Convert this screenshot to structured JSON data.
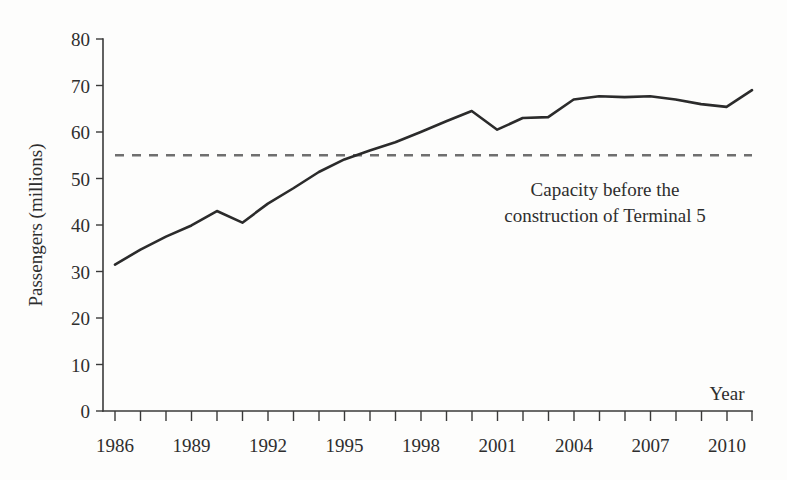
{
  "chart_data": {
    "type": "line",
    "title": "",
    "xlabel": "Year",
    "ylabel": "Passengers (millions)",
    "xlim": [
      1986,
      2011
    ],
    "ylim": [
      0,
      80
    ],
    "grid": false,
    "legend": "none",
    "x_tick_labels": [
      "1986",
      "1989",
      "1992",
      "1995",
      "1998",
      "2001",
      "2004",
      "2007",
      "2010"
    ],
    "x_tick_values": [
      1986,
      1989,
      1992,
      1995,
      1998,
      2001,
      2004,
      2007,
      2010
    ],
    "x_minor_ticks_every": 1,
    "y_tick_labels": [
      "0",
      "10",
      "20",
      "30",
      "40",
      "50",
      "60",
      "70",
      "80"
    ],
    "y_tick_values": [
      0,
      10,
      20,
      30,
      40,
      50,
      60,
      70,
      80
    ],
    "series": [
      {
        "name": "Passengers",
        "color": "#2b2b2b",
        "style": "solid",
        "x": [
          1986,
          1987,
          1988,
          1989,
          1990,
          1991,
          1992,
          1993,
          1994,
          1995,
          1996,
          1997,
          1998,
          1999,
          2000,
          2001,
          2002,
          2003,
          2004,
          2005,
          2006,
          2007,
          2008,
          2009,
          2010,
          2011
        ],
        "values": [
          31.5,
          34.7,
          37.5,
          39.9,
          43.0,
          40.5,
          44.6,
          47.9,
          51.4,
          54.1,
          56.0,
          57.8,
          60.0,
          62.3,
          64.5,
          60.5,
          63.0,
          63.2,
          67.0,
          67.7,
          67.5,
          67.7,
          67.0,
          66.0,
          65.4,
          69.0
        ]
      }
    ],
    "reference_line": {
      "name": "Capacity before the construction of Terminal 5",
      "value": 55,
      "color": "#6f6f6f",
      "style": "dashed",
      "dash_pattern": "9,8"
    },
    "annotations": [
      {
        "id": "capacity-note",
        "line1": "Capacity  before the",
        "line2": "construction of Terminal 5",
        "x_center": 605,
        "y_top": 180
      }
    ]
  },
  "colors": {
    "background": "#fdfdfc",
    "axis": "#3a3a3a",
    "series": "#2b2b2b",
    "reference": "#6f6f6f",
    "text": "#2e2e2e"
  }
}
